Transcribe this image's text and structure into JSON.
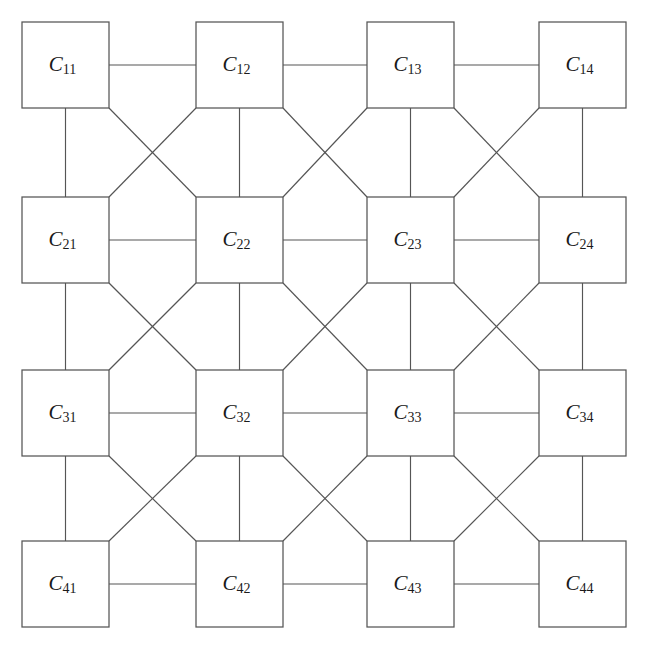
{
  "diagram": {
    "type": "lattice-graph",
    "rows": 4,
    "columns": 4,
    "background_color": "#ffffff",
    "stroke_color": "#555555",
    "label_color": "#1a1a1a",
    "box_fill": "#ffffff"
  },
  "geometry": {
    "width": 647,
    "height": 653,
    "box_width": 87,
    "box_height": 86,
    "column_x": [
      22,
      196,
      367,
      539
    ],
    "row_y": [
      22,
      197,
      370,
      541
    ]
  },
  "nodes": [
    {
      "id": "C11",
      "base": "C",
      "sub": "11",
      "row": 1,
      "col": 1
    },
    {
      "id": "C12",
      "base": "C",
      "sub": "12",
      "row": 1,
      "col": 2
    },
    {
      "id": "C13",
      "base": "C",
      "sub": "13",
      "row": 1,
      "col": 3
    },
    {
      "id": "C14",
      "base": "C",
      "sub": "14",
      "row": 1,
      "col": 4
    },
    {
      "id": "C21",
      "base": "C",
      "sub": "21",
      "row": 2,
      "col": 1
    },
    {
      "id": "C22",
      "base": "C",
      "sub": "22",
      "row": 2,
      "col": 2
    },
    {
      "id": "C23",
      "base": "C",
      "sub": "23",
      "row": 2,
      "col": 3
    },
    {
      "id": "C24",
      "base": "C",
      "sub": "24",
      "row": 2,
      "col": 4
    },
    {
      "id": "C31",
      "base": "C",
      "sub": "31",
      "row": 3,
      "col": 1
    },
    {
      "id": "C32",
      "base": "C",
      "sub": "32",
      "row": 3,
      "col": 2
    },
    {
      "id": "C33",
      "base": "C",
      "sub": "33",
      "row": 3,
      "col": 3
    },
    {
      "id": "C34",
      "base": "C",
      "sub": "34",
      "row": 3,
      "col": 4
    },
    {
      "id": "C41",
      "base": "C",
      "sub": "41",
      "row": 4,
      "col": 1
    },
    {
      "id": "C42",
      "base": "C",
      "sub": "42",
      "row": 4,
      "col": 2
    },
    {
      "id": "C43",
      "base": "C",
      "sub": "43",
      "row": 4,
      "col": 3
    },
    {
      "id": "C44",
      "base": "C",
      "sub": "44",
      "row": 4,
      "col": 4
    }
  ],
  "edges": {
    "horizontal": [
      [
        "C11",
        "C12"
      ],
      [
        "C12",
        "C13"
      ],
      [
        "C13",
        "C14"
      ],
      [
        "C21",
        "C22"
      ],
      [
        "C22",
        "C23"
      ],
      [
        "C23",
        "C24"
      ],
      [
        "C31",
        "C32"
      ],
      [
        "C32",
        "C33"
      ],
      [
        "C33",
        "C34"
      ],
      [
        "C41",
        "C42"
      ],
      [
        "C42",
        "C43"
      ],
      [
        "C43",
        "C44"
      ]
    ],
    "vertical": [
      [
        "C11",
        "C21"
      ],
      [
        "C21",
        "C31"
      ],
      [
        "C31",
        "C41"
      ],
      [
        "C12",
        "C22"
      ],
      [
        "C22",
        "C32"
      ],
      [
        "C32",
        "C42"
      ],
      [
        "C13",
        "C23"
      ],
      [
        "C23",
        "C33"
      ],
      [
        "C33",
        "C43"
      ],
      [
        "C14",
        "C24"
      ],
      [
        "C24",
        "C34"
      ],
      [
        "C34",
        "C44"
      ]
    ],
    "diagonal_down_right": [
      [
        "C11",
        "C22"
      ],
      [
        "C12",
        "C23"
      ],
      [
        "C13",
        "C24"
      ],
      [
        "C21",
        "C32"
      ],
      [
        "C22",
        "C33"
      ],
      [
        "C23",
        "C34"
      ],
      [
        "C31",
        "C42"
      ],
      [
        "C32",
        "C43"
      ],
      [
        "C33",
        "C44"
      ]
    ],
    "diagonal_down_left": [
      [
        "C12",
        "C21"
      ],
      [
        "C13",
        "C22"
      ],
      [
        "C14",
        "C23"
      ],
      [
        "C22",
        "C31"
      ],
      [
        "C23",
        "C32"
      ],
      [
        "C24",
        "C33"
      ],
      [
        "C32",
        "C41"
      ],
      [
        "C33",
        "C42"
      ],
      [
        "C34",
        "C43"
      ]
    ]
  }
}
